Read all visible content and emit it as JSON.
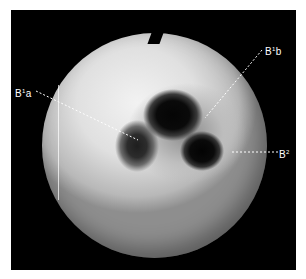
{
  "figure": {
    "labels": [
      {
        "id": "b1a",
        "base": "B",
        "sup": "1",
        "suffix": "a"
      },
      {
        "id": "b1b",
        "base": "B",
        "sup": "1",
        "suffix": "b"
      },
      {
        "id": "b2",
        "base": "B",
        "sup": "2",
        "suffix": ""
      }
    ],
    "colors": {
      "frame": "#000000",
      "background": "#ffffff",
      "label": "#ffffff"
    }
  }
}
